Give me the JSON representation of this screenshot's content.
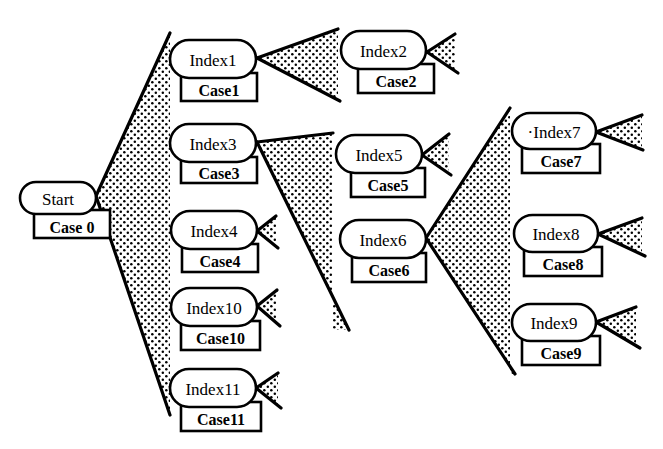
{
  "colors": {
    "ink": "#000000",
    "paper": "#ffffff",
    "stipple": "#000000"
  },
  "nodes": [
    {
      "id": "start",
      "label": "Start",
      "case": "Case 0",
      "x": 20,
      "y": 182,
      "w": 76,
      "h": 32,
      "cx": 34,
      "cy": 214,
      "cw": 76,
      "ch": 24
    },
    {
      "id": "index1",
      "label": "Index1",
      "case": "Case1",
      "x": 170,
      "y": 40,
      "w": 86,
      "h": 38,
      "cx": 181,
      "cy": 77,
      "cw": 76,
      "ch": 24
    },
    {
      "id": "index2",
      "label": "Index2",
      "case": "Case2",
      "x": 341,
      "y": 31,
      "w": 85,
      "h": 38,
      "cx": 358,
      "cy": 68,
      "cw": 76,
      "ch": 25
    },
    {
      "id": "index3",
      "label": "Index3",
      "case": "Case3",
      "x": 170,
      "y": 124,
      "w": 86,
      "h": 38,
      "cx": 181,
      "cy": 161,
      "cw": 76,
      "ch": 22
    },
    {
      "id": "index4",
      "label": "Index4",
      "case": "Case4",
      "x": 171,
      "y": 211,
      "w": 86,
      "h": 38,
      "cx": 182,
      "cy": 248,
      "cw": 76,
      "ch": 24
    },
    {
      "id": "index5",
      "label": "Index5",
      "case": "Case5",
      "x": 336,
      "y": 135,
      "w": 86,
      "h": 38,
      "cx": 351,
      "cy": 172,
      "cw": 74,
      "ch": 25
    },
    {
      "id": "index6",
      "label": "Index6",
      "case": "Case6",
      "x": 340,
      "y": 220,
      "w": 86,
      "h": 38,
      "cx": 352,
      "cy": 257,
      "cw": 74,
      "ch": 25
    },
    {
      "id": "index7",
      "label": "·Index7",
      "case": "Case7",
      "x": 512,
      "y": 113,
      "w": 84,
      "h": 36,
      "cx": 522,
      "cy": 148,
      "cw": 78,
      "ch": 25
    },
    {
      "id": "index8",
      "label": "Index8",
      "case": "Case8",
      "x": 514,
      "y": 215,
      "w": 84,
      "h": 37,
      "cx": 524,
      "cy": 251,
      "cw": 78,
      "ch": 25
    },
    {
      "id": "index9",
      "label": "Index9",
      "case": "Case9",
      "x": 512,
      "y": 304,
      "w": 84,
      "h": 37,
      "cx": 522,
      "cy": 340,
      "cw": 78,
      "ch": 25
    },
    {
      "id": "index10",
      "label": "Index10",
      "case": "Case10",
      "x": 171,
      "y": 288,
      "w": 86,
      "h": 38,
      "cx": 181,
      "cy": 325,
      "cw": 79,
      "ch": 25
    },
    {
      "id": "index11",
      "label": "Index11",
      "case": "Case11",
      "x": 170,
      "y": 369,
      "w": 86,
      "h": 38,
      "cx": 181,
      "cy": 406,
      "cw": 80,
      "ch": 25
    }
  ],
  "fans": [
    {
      "from": "start",
      "apex": [
        96,
        196
      ],
      "top": [
        170,
        33
      ],
      "bottom": [
        170,
        415
      ]
    },
    {
      "from": "index1",
      "apex": [
        257,
        58
      ],
      "top": [
        338,
        29
      ],
      "bottom": [
        340,
        101
      ]
    },
    {
      "from": "index3",
      "apex": [
        257,
        142
      ],
      "top": [
        333,
        133
      ],
      "bottom": [
        349,
        330
      ]
    },
    {
      "from": "index6",
      "apex": [
        426,
        238
      ],
      "top": [
        510,
        108
      ],
      "bottom": [
        515,
        374
      ]
    }
  ],
  "stubs": [
    {
      "from": "index2",
      "apex": [
        427,
        52
      ],
      "top": [
        455,
        34
      ],
      "bottom": [
        458,
        73
      ]
    },
    {
      "from": "index4",
      "apex": [
        257,
        231
      ],
      "top": [
        276,
        216
      ],
      "bottom": [
        278,
        248
      ]
    },
    {
      "from": "index5",
      "apex": [
        422,
        155
      ],
      "top": [
        449,
        134
      ],
      "bottom": [
        451,
        175
      ]
    },
    {
      "from": "index7",
      "apex": [
        596,
        132
      ],
      "top": [
        642,
        115
      ],
      "bottom": [
        643,
        150
      ]
    },
    {
      "from": "index8",
      "apex": [
        598,
        234
      ],
      "top": [
        642,
        218
      ],
      "bottom": [
        645,
        256
      ]
    },
    {
      "from": "index9",
      "apex": [
        596,
        322
      ],
      "top": [
        636,
        307
      ],
      "bottom": [
        640,
        348
      ]
    },
    {
      "from": "index10",
      "apex": [
        257,
        306
      ],
      "top": [
        277,
        290
      ],
      "bottom": [
        280,
        326
      ]
    },
    {
      "from": "index11",
      "apex": [
        256,
        388
      ],
      "top": [
        278,
        373
      ],
      "bottom": [
        281,
        408
      ]
    }
  ]
}
